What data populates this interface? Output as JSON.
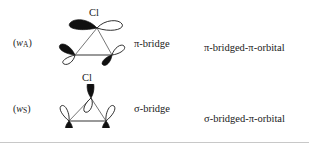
{
  "figure": {
    "background_color": "#ffffff",
    "ink_color": "#1a1a1a",
    "lobe_filled_color": "#101010",
    "lobe_empty_color": "#ffffff",
    "bond_color": "#555555",
    "width_px": 309,
    "height_px": 143
  },
  "rows": [
    {
      "orbital_label_open": "(",
      "orbital_label_w": "w",
      "orbital_label_sub": "A",
      "orbital_label_close": ")",
      "atom_label": "Cl",
      "bridge_label": "π-bridge",
      "description_label": "π-bridged-π-orbital",
      "apex_orbital_orientation": "horizontal",
      "base_orbital_orientation": "tilted"
    },
    {
      "orbital_label_open": "(",
      "orbital_label_w": "w",
      "orbital_label_sub": "S",
      "orbital_label_close": ")",
      "atom_label": "Cl",
      "bridge_label": "σ-bridge",
      "description_label": "σ-bridged-π-orbital",
      "apex_orbital_orientation": "vertical",
      "base_orbital_orientation": "vertical"
    }
  ]
}
